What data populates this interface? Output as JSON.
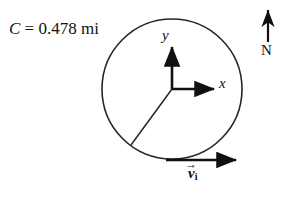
{
  "figure": {
    "background_color": "#ffffff",
    "stroke_color": "#1a1a1a",
    "caption": {
      "variable": "C",
      "equals": " = ",
      "value": "0.478 mi",
      "full_text": "C = 0.478 mi"
    },
    "axes": {
      "x_label": "x",
      "y_label": "y"
    },
    "compass": {
      "label": "N",
      "direction": "up"
    },
    "velocity": {
      "symbol": "v",
      "subscript": "i",
      "vector_accent": "→",
      "full_text": "vᵢ"
    },
    "circle": {
      "center_x": 172,
      "center_y": 89,
      "radius": 70
    }
  }
}
